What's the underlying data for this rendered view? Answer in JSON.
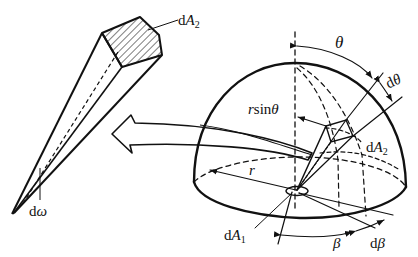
{
  "figure": {
    "labels": {
      "cone_area": {
        "prefix": "d",
        "var": "A",
        "sub": "2"
      },
      "cone_solid_angle": {
        "prefix": "d",
        "var": "ω"
      },
      "theta": "θ",
      "dtheta": {
        "prefix": "d",
        "var": "θ"
      },
      "rsintheta": {
        "r": "r",
        "fn": "sin",
        "var": "θ"
      },
      "hemi_area": {
        "prefix": "d",
        "var": "A",
        "sub": "2"
      },
      "radius": "r",
      "base_area": {
        "prefix": "d",
        "var": "A",
        "sub": "1"
      },
      "beta": "β",
      "dbeta": {
        "prefix": "d",
        "var": "β"
      }
    },
    "colors": {
      "stroke": "#111111",
      "background": "#ffffff"
    }
  }
}
